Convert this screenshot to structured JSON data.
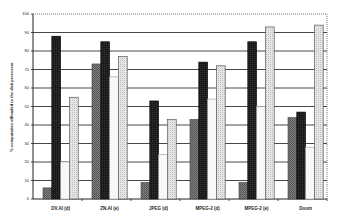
{
  "chart_data": {
    "type": "bar",
    "title": "",
    "xlabel": "",
    "ylabel": "% computation offloaded to the disk processor",
    "ylim": [
      0,
      100
    ],
    "yticks": [
      0,
      10,
      20,
      30,
      40,
      50,
      60,
      70,
      80,
      90,
      100
    ],
    "grid": true,
    "legend": "none",
    "categories": [
      "DV.AI (d)",
      "ZN.AI (e)",
      "JPEG (d)",
      "MPEG-2 (d)",
      "MPEG-2 (e)",
      "Doom"
    ],
    "series": [
      {
        "name": "series-1",
        "pattern": "dark-gray-hatched",
        "color": "#707070",
        "values": [
          6,
          73,
          9,
          43,
          9,
          44
        ]
      },
      {
        "name": "series-2",
        "pattern": "black-hatched",
        "color": "#1a1a1a",
        "values": [
          88,
          85,
          53,
          74,
          85,
          47
        ]
      },
      {
        "name": "series-3",
        "pattern": "white",
        "color": "#f8f8f8",
        "values": [
          20,
          66,
          24,
          54,
          50,
          28
        ]
      },
      {
        "name": "series-4",
        "pattern": "light-gray-dotted",
        "color": "#d8d8d8",
        "values": [
          55,
          77,
          43,
          72,
          93,
          94
        ]
      }
    ]
  }
}
